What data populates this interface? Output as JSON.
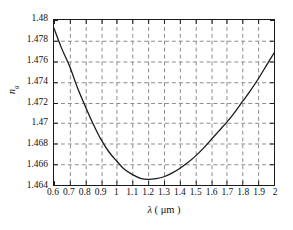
{
  "chart_data": {
    "type": "line",
    "title": "",
    "subtitle": "",
    "xlabel": "λ ( μm )",
    "xlabel_symbol": "λ",
    "xlabel_units": "( μm )",
    "ylabel": "n",
    "ylabel_symbol": "n",
    "ylabel_subscript": "g",
    "xlim": [
      0.6,
      2.0
    ],
    "ylim": [
      1.464,
      1.48
    ],
    "grid": true,
    "grid_style": "dashed",
    "legend": "none",
    "xticks": [
      0.6,
      0.7,
      0.8,
      0.9,
      1.0,
      1.1,
      1.2,
      1.3,
      1.4,
      1.5,
      1.6,
      1.7,
      1.8,
      1.9,
      2.0
    ],
    "xtick_labels": [
      "0.6",
      "0.7",
      "0.8",
      "0.9",
      "1",
      "1.1",
      "1.2",
      "1.3",
      "1.4",
      "1.5",
      "1.6",
      "1.7",
      "1.8",
      "1.9",
      "2"
    ],
    "yticks": [
      1.464,
      1.466,
      1.468,
      1.47,
      1.472,
      1.474,
      1.476,
      1.478,
      1.48
    ],
    "ytick_labels": [
      "1.464",
      "1.466",
      "1.468",
      "1.47",
      "1.472",
      "1.474",
      "1.476",
      "1.478",
      "1.48"
    ],
    "series": [
      {
        "name": "refractive-index",
        "color": "#1a1a1a",
        "line_width": 1.3,
        "x": [
          0.6,
          0.65,
          0.7,
          0.75,
          0.8,
          0.85,
          0.9,
          0.95,
          1.0,
          1.05,
          1.1,
          1.15,
          1.2,
          1.25,
          1.3,
          1.35,
          1.4,
          1.45,
          1.5,
          1.55,
          1.6,
          1.65,
          1.7,
          1.75,
          1.8,
          1.85,
          1.9,
          1.95,
          2.0
        ],
        "values": [
          1.4792,
          1.4772,
          1.4755,
          1.4734,
          1.4716,
          1.4699,
          1.4684,
          1.4672,
          1.4663,
          1.4655,
          1.465,
          1.46465,
          1.46455,
          1.46462,
          1.4648,
          1.46515,
          1.4656,
          1.46615,
          1.4668,
          1.46755,
          1.4684,
          1.46925,
          1.4701,
          1.47105,
          1.4721,
          1.47315,
          1.4743,
          1.47555,
          1.4768
        ]
      }
    ]
  }
}
